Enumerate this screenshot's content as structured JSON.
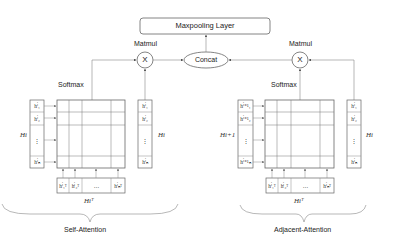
{
  "diagram": {
    "top": {
      "label": "Maxpooling Layer"
    },
    "concat": {
      "label": "Concat"
    },
    "left": {
      "matmul_label": "Matmul",
      "op_symbol": "X",
      "softmax_label": "Softmax",
      "left_column_label": "Hi",
      "left_column_cells": [
        "hⁱ₁",
        "hⁱ₂",
        "⋮",
        "hⁱₙ"
      ],
      "right_column_label": "Hi",
      "right_column_cells": [
        "hⁱ₁",
        "hⁱ₂",
        "⋮",
        "hⁱₙ"
      ],
      "bottom_row_label": "Hiᵀ",
      "bottom_row_cells": [
        "hⁱ₁ᵀ",
        "hⁱ₂ᵀ",
        "…",
        "hⁱₙᵀ"
      ],
      "brace_label": "Self-Attention"
    },
    "right": {
      "matmul_label": "Matmul",
      "op_symbol": "X",
      "softmax_label": "Softmax",
      "left_column_label": "Hi+1",
      "left_column_cells": [
        "hⁱ⁺¹₁",
        "hⁱ⁺¹₂",
        "⋮",
        "hⁱ⁺¹ₙ"
      ],
      "right_column_label": "Hi",
      "right_column_cells": [
        "hⁱ₁",
        "hⁱ₂",
        "⋮",
        "hⁱₙ"
      ],
      "bottom_row_label": "Hiᵀ",
      "bottom_row_cells": [
        "hⁱ₁ᵀ",
        "hⁱ₂ᵀ",
        "…",
        "hⁱₙᵀ"
      ],
      "brace_label": "Adjacent-Attention"
    }
  }
}
